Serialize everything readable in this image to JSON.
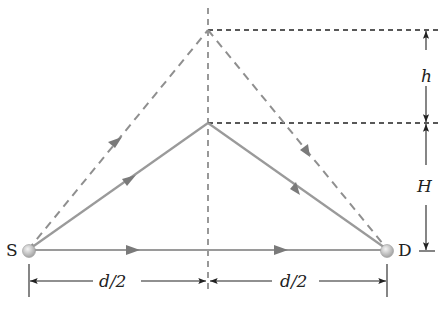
{
  "diagram": {
    "labels": {
      "source": "S",
      "detector": "D",
      "h": "h",
      "H": "H",
      "half_left": "d/2",
      "half_right": "d/2"
    },
    "paths": [
      {
        "name": "direct-path",
        "from": "S",
        "to": "D",
        "style": "solid"
      },
      {
        "name": "reflected-path-lower",
        "via": "apex at height H",
        "style": "solid"
      },
      {
        "name": "reflected-path-upper",
        "via": "apex at height H+h",
        "style": "dashed"
      }
    ],
    "colors": {
      "path": "#9a9a9a",
      "arrow": "#7a7a7a",
      "dim": "#222222",
      "node": "#c8c8c8"
    }
  }
}
